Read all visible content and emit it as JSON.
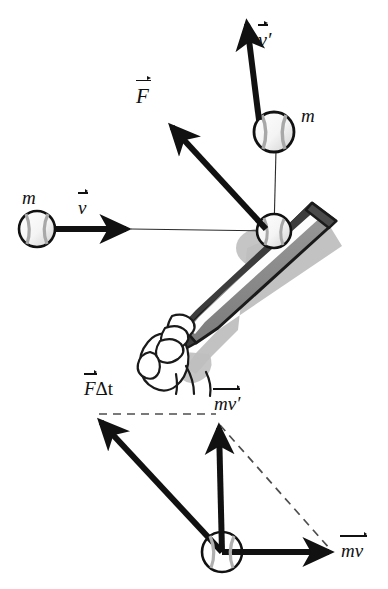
{
  "figure": {
    "background_color": "#ffffff",
    "ink_color": "#111111",
    "bat_shadow_color": "#b9b9b9",
    "bat_body_color": "#8a8a8a",
    "bat_dark_color": "#3a3a3a"
  },
  "upper_panel": {
    "description": "Baseball of mass m moving with velocity v strikes a bat and rebounds with velocity v-prime; force F acts on the ball.",
    "labels": {
      "mass_incoming": "m",
      "velocity_incoming": "v",
      "force": "F",
      "velocity_outgoing": "v",
      "velocity_outgoing_prime": "′",
      "mass_outgoing": "m"
    },
    "vectors": [
      {
        "name": "v",
        "label": "v",
        "style": "solid-thick",
        "from_x": 55,
        "from_y": 229,
        "to_x": 131,
        "to_y": 229
      },
      {
        "name": "F",
        "label": "F",
        "style": "solid-thick",
        "from_x": 266,
        "from_y": 229,
        "to_x": 167,
        "to_y": 121
      },
      {
        "name": "v'",
        "label": "v′",
        "style": "solid-thick",
        "from_x": 259,
        "from_y": 120,
        "to_x": 246,
        "to_y": 17
      }
    ],
    "balls": [
      {
        "name": "incoming-ball",
        "cx": 37,
        "cy": 229,
        "r": 18
      },
      {
        "name": "contact-ball",
        "cx": 274,
        "cy": 231,
        "r": 17
      },
      {
        "name": "outgoing-ball",
        "cx": 274,
        "cy": 132,
        "r": 20
      }
    ],
    "trajectory_lines": [
      {
        "name": "incoming-path",
        "from_x": 131,
        "from_y": 229,
        "to_x": 274,
        "to_y": 231
      },
      {
        "name": "outgoing-path",
        "from_x": 274,
        "from_y": 231,
        "to_x": 276,
        "to_y": 150
      }
    ]
  },
  "lower_panel": {
    "description": "Vector addition: momentum mv plus impulse F-delta-t equals new momentum mv-prime, drawn as a parallelogram.",
    "labels": {
      "impulse": "F",
      "impulse_suffix": "Δt",
      "momentum_final": "mv",
      "momentum_final_prime": "′",
      "momentum_initial": "mv"
    },
    "origin": {
      "name": "origin-ball",
      "cx": 222,
      "cy": 552,
      "r": 20
    },
    "vectors": [
      {
        "name": "F-delta-t",
        "label": "FΔt",
        "style": "solid-thick",
        "from_x": 222,
        "from_y": 552,
        "to_x": 96,
        "to_y": 417
      },
      {
        "name": "mv-prime",
        "label": "mv′",
        "style": "solid-thick",
        "from_x": 222,
        "from_y": 552,
        "to_x": 218,
        "to_y": 421
      },
      {
        "name": "mv",
        "label": "mv",
        "style": "solid-thick",
        "from_x": 222,
        "from_y": 552,
        "to_x": 334,
        "to_y": 552
      }
    ],
    "dashed_lines": [
      {
        "name": "dashed-top",
        "from_x": 99,
        "from_y": 414,
        "to_x": 216,
        "to_y": 414
      },
      {
        "name": "dashed-right",
        "from_x": 219,
        "from_y": 424,
        "to_x": 330,
        "to_y": 549
      }
    ]
  }
}
